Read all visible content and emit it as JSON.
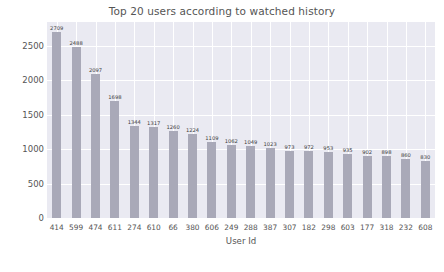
{
  "chart_data": {
    "type": "bar",
    "title": "Top 20 users according to watched history",
    "xlabel": "User Id",
    "ylabel": "",
    "categories": [
      "414",
      "599",
      "474",
      "611",
      "274",
      "610",
      "66",
      "380",
      "606",
      "249",
      "288",
      "387",
      "307",
      "182",
      "298",
      "603",
      "177",
      "318",
      "232",
      "608"
    ],
    "values": [
      2709,
      2488,
      2097,
      1698,
      1344,
      1317,
      1260,
      1224,
      1109,
      1062,
      1049,
      1023,
      973,
      972,
      953,
      935,
      902,
      898,
      860,
      830
    ],
    "ylim": [
      0,
      2850
    ],
    "yticks": [
      0,
      500,
      1000,
      1500,
      2000,
      2500
    ],
    "ytick_labels": [
      "0",
      "500",
      "1000",
      "1500",
      "2000",
      "2500"
    ],
    "grid": true,
    "legend": false,
    "bar_color": "#a9a9b8",
    "plot_background": "#eaeaf2",
    "text_color": "#555555"
  }
}
